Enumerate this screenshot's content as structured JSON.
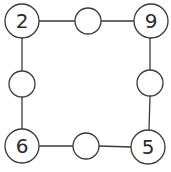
{
  "diagram": {
    "type": "number-square-puzzle",
    "stroke_color": "#3a3a3a",
    "corners": [
      {
        "id": "top-left",
        "label": "2",
        "cx": 22,
        "cy": 21,
        "r": 17
      },
      {
        "id": "top-right",
        "label": "9",
        "cx": 151,
        "cy": 21,
        "r": 17
      },
      {
        "id": "bottom-left",
        "label": "6",
        "cx": 22,
        "cy": 146,
        "r": 17
      },
      {
        "id": "bottom-right",
        "label": "5",
        "cx": 148,
        "cy": 147,
        "r": 17
      }
    ],
    "midpoints": [
      {
        "id": "top",
        "label": "",
        "cx": 88,
        "cy": 21,
        "r": 13
      },
      {
        "id": "left",
        "label": "",
        "cx": 22,
        "cy": 84,
        "r": 13
      },
      {
        "id": "right",
        "label": "",
        "cx": 150,
        "cy": 83,
        "r": 13
      },
      {
        "id": "bottom",
        "label": "",
        "cx": 86,
        "cy": 146,
        "r": 13
      }
    ]
  }
}
